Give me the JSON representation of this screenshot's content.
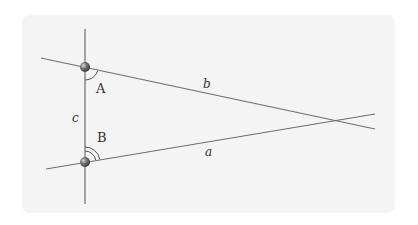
{
  "diagram": {
    "type": "geometry",
    "colors": {
      "background": "#ffffff",
      "panel": "#f4f4f4",
      "line": "#6e6e6e",
      "point": "#5a5a5a",
      "arc": "#555555",
      "label": "#333333"
    },
    "points": [
      {
        "id": "A",
        "label": "A",
        "x": 85,
        "y": 67
      },
      {
        "id": "B",
        "label": "B",
        "x": 85,
        "y": 162
      }
    ],
    "lines": [
      {
        "id": "c",
        "label": "c",
        "x1": 85,
        "y1": 29,
        "x2": 85,
        "y2": 204
      },
      {
        "id": "b",
        "label": "b",
        "x1": 41,
        "y1": 58,
        "x2": 375,
        "y2": 129
      },
      {
        "id": "a",
        "label": "a",
        "x1": 46,
        "y1": 169,
        "x2": 375,
        "y2": 114
      }
    ],
    "angle_marks": [
      {
        "at": "A",
        "arcs": 1
      },
      {
        "at": "B",
        "arcs": 2
      }
    ],
    "labels": {
      "A": "A",
      "B": "B",
      "a": "a",
      "b": "b",
      "c": "c"
    }
  }
}
